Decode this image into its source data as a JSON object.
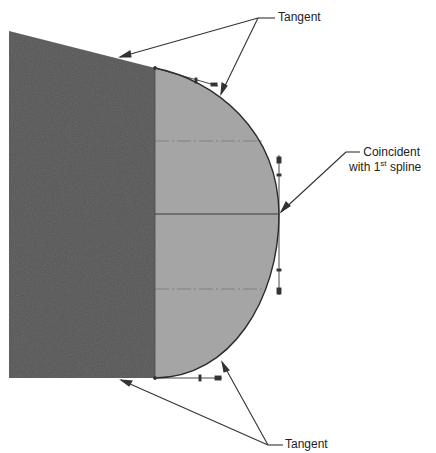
{
  "diagram": {
    "colors": {
      "dark_body": "#565656",
      "light_body": "#a5a5a5",
      "outline": "#2a2a2a",
      "leader": "#333333",
      "centerline": "#7a7a7a",
      "background": "#ffffff"
    },
    "labels": {
      "top_tangent": "Tangent",
      "coincident_line1": "Coincident",
      "coincident_line2_prefix": "with 1",
      "coincident_line2_sup": "st",
      "coincident_line2_suffix": " spline",
      "bottom_tangent": "Tangent"
    }
  }
}
